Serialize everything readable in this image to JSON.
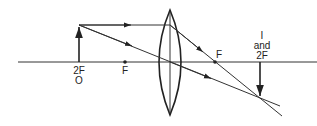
{
  "diagram": {
    "labels": {
      "object_position": "2F",
      "object": "O",
      "focus_left": "F",
      "focus_right": "F",
      "image_line1": "I",
      "image_line2": "and",
      "image_line3": "2F"
    },
    "elements": [
      "principal-axis",
      "convex-lens",
      "object-arrow",
      "image-arrow",
      "parallel-ray",
      "center-ray",
      "focal-point-left",
      "focal-point-right"
    ],
    "colors": {
      "ink": "#222222",
      "background": "#ffffff"
    }
  }
}
